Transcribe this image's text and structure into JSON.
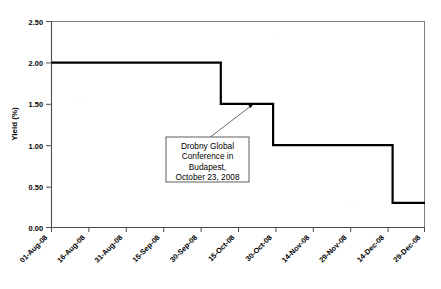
{
  "chart_data": {
    "type": "line",
    "subtype": "step",
    "title": "",
    "xlabel": "",
    "ylabel": "Yield (%)",
    "ylim": [
      0.0,
      2.5
    ],
    "ytick_labels": [
      "0.00",
      "0.50",
      "1.00",
      "1.50",
      "2.00",
      "2.50"
    ],
    "ytick_values": [
      0.0,
      0.5,
      1.0,
      1.5,
      2.0,
      2.5
    ],
    "xtick_labels": [
      "01-Aug-08",
      "16-Aug-08",
      "31-Aug-08",
      "15-Sep-08",
      "30-Sep-08",
      "15-Oct-08",
      "30-Oct-08",
      "14-Nov-08",
      "29-Nov-08",
      "14-Dec-08",
      "29-Dec-08"
    ],
    "xtick_rotation": 45,
    "grid": false,
    "legend": "none",
    "line_color": "#000000",
    "line_width": 2.2,
    "x_range": [
      "01-Aug-08",
      "29-Dec-08"
    ],
    "steps": [
      {
        "from": "01-Aug-08",
        "to": "08-Oct-08",
        "value": 2.0
      },
      {
        "from": "08-Oct-08",
        "to": "29-Oct-08",
        "value": 1.5
      },
      {
        "from": "29-Oct-08",
        "to": "16-Dec-08",
        "value": 1.0
      },
      {
        "from": "16-Dec-08",
        "to": "29-Dec-08",
        "value": 0.3
      }
    ],
    "x": [
      "01-Aug-08",
      "08-Oct-08",
      "08-Oct-08",
      "29-Oct-08",
      "29-Oct-08",
      "16-Dec-08",
      "16-Dec-08",
      "29-Dec-08"
    ],
    "values": [
      2.0,
      2.0,
      1.5,
      1.5,
      1.0,
      1.0,
      0.3,
      0.3
    ],
    "annotations": [
      {
        "lines": [
          "Drobny Global",
          "Conference in",
          "Budapest,",
          "October 23, 2008"
        ],
        "text": "Drobny Global Conference in Budapest, October 23, 2008",
        "points_to_x": "23-Oct-08",
        "points_to_y": 1.5,
        "box": true,
        "arrow": true
      }
    ]
  },
  "axes": {
    "y_axis_title": "Yield (%)"
  }
}
